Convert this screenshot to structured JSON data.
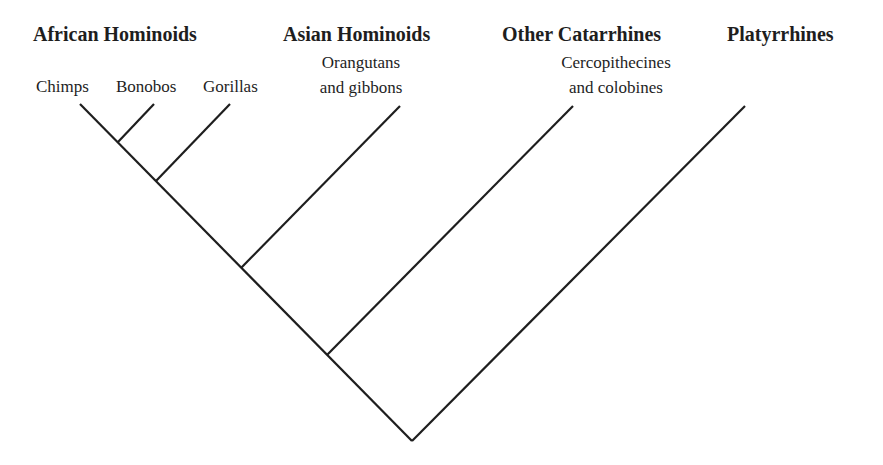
{
  "diagram": {
    "type": "phylogenetic-cladogram",
    "line_color": "#1e1e1e",
    "groups": [
      {
        "label": "African Hominoids"
      },
      {
        "label": "Asian Hominoids"
      },
      {
        "label": "Other Catarrhines"
      },
      {
        "label": "Platyrrhines"
      }
    ],
    "taxa": [
      {
        "label": "Chimps",
        "group": "African Hominoids"
      },
      {
        "label": "Bonobos",
        "group": "African Hominoids"
      },
      {
        "label": "Gorillas",
        "group": "African Hominoids"
      },
      {
        "line1": "Orangutans",
        "line2": "and gibbons",
        "group": "Asian Hominoids"
      },
      {
        "line1": "Cercopithecines",
        "line2": "and colobines",
        "group": "Other Catarrhines"
      },
      {
        "label": "",
        "group": "Platyrrhines"
      }
    ],
    "topology": "(((((Chimps,Bonobos),Gorillas),Orangutans and gibbons),Cercopithecines and colobines),Platyrrhines)"
  }
}
